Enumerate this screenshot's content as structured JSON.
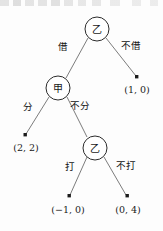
{
  "diagram": {
    "type": "extensive-form-game-tree",
    "title": "",
    "decision_nodes": [
      {
        "id": "root",
        "player": "乙",
        "cx": 97,
        "cy": 29,
        "r": 12
      },
      {
        "id": "jia",
        "player": "甲",
        "cx": 58,
        "cy": 88,
        "r": 12
      },
      {
        "id": "yi_second",
        "player": "乙",
        "cx": 95,
        "cy": 148,
        "r": 12
      }
    ],
    "edges": [
      {
        "from": "root",
        "to": "jia",
        "label": "借",
        "label_x": 63,
        "label_y": 46,
        "x1": 88,
        "y1": 38,
        "x2": 66,
        "y2": 78
      },
      {
        "from": "root",
        "to": "t_1_0",
        "label": "不借",
        "label_x": 131,
        "label_y": 45,
        "x1": 106,
        "y1": 38,
        "x2": 136,
        "y2": 76
      },
      {
        "from": "jia",
        "to": "t_2_2",
        "label": "分",
        "label_x": 28,
        "label_y": 106,
        "x1": 49,
        "y1": 97,
        "x2": 26,
        "y2": 134
      },
      {
        "from": "jia",
        "to": "yi_second",
        "label": "不分",
        "label_x": 80,
        "label_y": 105,
        "x1": 67,
        "y1": 97,
        "x2": 87,
        "y2": 137
      },
      {
        "from": "yi_second",
        "to": "t_m1_0",
        "label": "打",
        "label_x": 70,
        "label_y": 166,
        "x1": 87,
        "y1": 157,
        "x2": 70,
        "y2": 195
      },
      {
        "from": "yi_second",
        "to": "t_0_4",
        "label": "不打",
        "label_x": 126,
        "label_y": 165,
        "x1": 104,
        "y1": 157,
        "x2": 126,
        "y2": 195
      }
    ],
    "terminal_nodes": [
      {
        "id": "t_1_0",
        "payoff": "(1, 0)",
        "dot_x": 137,
        "dot_y": 77,
        "label_x": 137,
        "label_y": 89
      },
      {
        "id": "t_2_2",
        "payoff": "(2, 2)",
        "dot_x": 25,
        "dot_y": 135,
        "label_x": 26,
        "label_y": 147
      },
      {
        "id": "t_m1_0",
        "payoff": "(−1, 0)",
        "dot_x": 69,
        "dot_y": 196,
        "label_x": 68,
        "label_y": 209
      },
      {
        "id": "t_0_4",
        "payoff": "(0, 4)",
        "dot_x": 127,
        "dot_y": 196,
        "label_x": 128,
        "label_y": 209
      }
    ],
    "colors": {
      "node_stroke": "#2b2b2b",
      "edge_stroke": "#6d6d6d",
      "text": "#1a1a1a",
      "background": "#fdfdfd"
    }
  }
}
